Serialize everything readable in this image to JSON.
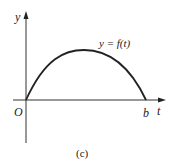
{
  "figure": {
    "caption": "(c)",
    "axes": {
      "y_label": "y",
      "x_label": "t",
      "origin_label": "O",
      "x_tick_label": "b"
    },
    "curve_label": "y = f(t)",
    "curve": {
      "shape": "concave-down arch",
      "start": "O",
      "end": "b"
    },
    "colors": {
      "stroke": "#222222",
      "axis": "#333333",
      "background": "#ffffff"
    }
  }
}
